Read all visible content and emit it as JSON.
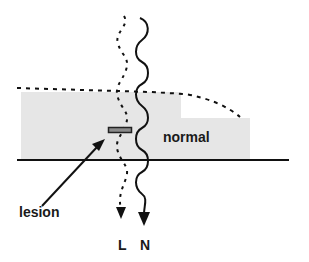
{
  "diagram": {
    "labels": {
      "normal": "normal",
      "lesion": "lesion",
      "L": "L",
      "N": "N"
    },
    "colors": {
      "region_fill": "#e6e6e6",
      "line": "#111111",
      "lesion_fill": "#8a8a8a"
    },
    "elements": [
      {
        "id": "tissue-region",
        "type": "shaded-area",
        "description": "Gray stepped region above baseline"
      },
      {
        "id": "baseline",
        "type": "solid-line"
      },
      {
        "id": "surface-dashed-curve",
        "type": "dashed-line"
      },
      {
        "id": "path-N",
        "type": "wavy-arrow",
        "style": "solid",
        "label": "N"
      },
      {
        "id": "path-L",
        "type": "wavy-arrow",
        "style": "dotted",
        "label": "L"
      },
      {
        "id": "lesion-bar",
        "type": "rectangle"
      },
      {
        "id": "lesion-pointer",
        "type": "arrow",
        "label": "lesion"
      }
    ]
  }
}
